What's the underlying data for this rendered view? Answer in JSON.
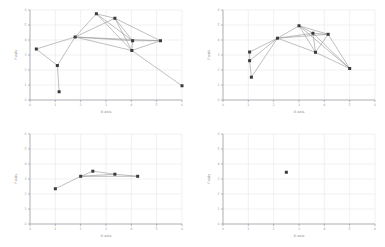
{
  "figure": {
    "background_color": "#ffffff",
    "panel_count": 4,
    "layout": "2x2 grid"
  },
  "style": {
    "edge_color": "#8c8c8c",
    "node_color": "#3a3a3a",
    "grid_color": "#e8e8ec",
    "axis_color": "#9a9aa2",
    "label_color": "#8d8d95"
  },
  "chart_data": [
    {
      "type": "scatter",
      "panel": "top-left",
      "title": "",
      "xlabel": "X-axis",
      "ylabel": "Y-axis",
      "xlim": [
        0,
        6
      ],
      "ylim": [
        0,
        6
      ],
      "xticks": [
        0,
        1,
        2,
        3,
        4,
        5,
        6
      ],
      "yticks": [
        0,
        1,
        2,
        3,
        4,
        5,
        6
      ],
      "grid": true,
      "legend": "none",
      "nodes": [
        {
          "id": 0,
          "x": 0.25,
          "y": 3.4
        },
        {
          "id": 1,
          "x": 1.08,
          "y": 2.3
        },
        {
          "id": 2,
          "x": 1.15,
          "y": 0.55
        },
        {
          "id": 3,
          "x": 1.78,
          "y": 4.2
        },
        {
          "id": 4,
          "x": 2.62,
          "y": 5.75
        },
        {
          "id": 5,
          "x": 3.35,
          "y": 5.45
        },
        {
          "id": 6,
          "x": 4.05,
          "y": 3.95
        },
        {
          "id": 7,
          "x": 4.02,
          "y": 3.3
        },
        {
          "id": 8,
          "x": 5.15,
          "y": 3.95
        },
        {
          "id": 9,
          "x": 6.0,
          "y": 0.95
        }
      ],
      "edges": [
        [
          0,
          1
        ],
        [
          1,
          2
        ],
        [
          1,
          3
        ],
        [
          0,
          3
        ],
        [
          3,
          4
        ],
        [
          3,
          5
        ],
        [
          3,
          6
        ],
        [
          3,
          7
        ],
        [
          3,
          8
        ],
        [
          4,
          5
        ],
        [
          4,
          6
        ],
        [
          4,
          7
        ],
        [
          5,
          6
        ],
        [
          5,
          7
        ],
        [
          5,
          8
        ],
        [
          6,
          7
        ],
        [
          6,
          8
        ],
        [
          7,
          8
        ],
        [
          7,
          9
        ]
      ]
    },
    {
      "type": "scatter",
      "panel": "top-right",
      "title": "",
      "xlabel": "X-axis",
      "ylabel": "Y-axis",
      "xlim": [
        0,
        6
      ],
      "ylim": [
        0,
        6
      ],
      "xticks": [
        0,
        1,
        2,
        3,
        4,
        5,
        6
      ],
      "yticks": [
        0,
        1,
        2,
        3,
        4,
        5,
        6
      ],
      "grid": true,
      "legend": "none",
      "nodes": [
        {
          "id": 0,
          "x": 1.05,
          "y": 3.2
        },
        {
          "id": 1,
          "x": 1.05,
          "y": 2.62
        },
        {
          "id": 2,
          "x": 1.12,
          "y": 1.52
        },
        {
          "id": 3,
          "x": 2.15,
          "y": 4.12
        },
        {
          "id": 4,
          "x": 3.0,
          "y": 4.95
        },
        {
          "id": 5,
          "x": 3.55,
          "y": 4.45
        },
        {
          "id": 6,
          "x": 4.15,
          "y": 4.38
        },
        {
          "id": 7,
          "x": 3.65,
          "y": 3.18
        },
        {
          "id": 8,
          "x": 5.0,
          "y": 2.1
        }
      ],
      "edges": [
        [
          0,
          1
        ],
        [
          1,
          2
        ],
        [
          0,
          3
        ],
        [
          1,
          3
        ],
        [
          2,
          3
        ],
        [
          3,
          4
        ],
        [
          3,
          5
        ],
        [
          3,
          6
        ],
        [
          3,
          7
        ],
        [
          4,
          5
        ],
        [
          4,
          6
        ],
        [
          4,
          7
        ],
        [
          4,
          8
        ],
        [
          5,
          6
        ],
        [
          5,
          7
        ],
        [
          5,
          8
        ],
        [
          6,
          7
        ],
        [
          6,
          8
        ],
        [
          7,
          8
        ]
      ]
    },
    {
      "type": "scatter",
      "panel": "bottom-left",
      "title": "",
      "xlabel": "X-axis",
      "ylabel": "Y-axis",
      "xlim": [
        0,
        6
      ],
      "ylim": [
        0,
        6
      ],
      "xticks": [
        0,
        1,
        2,
        3,
        4,
        5,
        6
      ],
      "yticks": [
        0,
        1,
        2,
        3,
        4,
        5,
        6
      ],
      "grid": true,
      "legend": "none",
      "nodes": [
        {
          "id": 0,
          "x": 1.0,
          "y": 2.35
        },
        {
          "id": 1,
          "x": 2.0,
          "y": 3.18
        },
        {
          "id": 2,
          "x": 2.48,
          "y": 3.52
        },
        {
          "id": 3,
          "x": 3.35,
          "y": 3.32
        },
        {
          "id": 4,
          "x": 4.25,
          "y": 3.18
        }
      ],
      "edges": [
        [
          0,
          1
        ],
        [
          1,
          2
        ],
        [
          2,
          3
        ],
        [
          3,
          4
        ],
        [
          1,
          4
        ],
        [
          1,
          3
        ]
      ]
    },
    {
      "type": "scatter",
      "panel": "bottom-right",
      "title": "",
      "xlabel": "X-axis",
      "ylabel": "Y-axis",
      "xlim": [
        0,
        6
      ],
      "ylim": [
        0,
        6
      ],
      "xticks": [
        0,
        1,
        2,
        3,
        4,
        5,
        6
      ],
      "yticks": [
        0,
        1,
        2,
        3,
        4,
        5,
        6
      ],
      "grid": true,
      "legend": "none",
      "nodes": [
        {
          "id": 0,
          "x": 2.5,
          "y": 3.45
        }
      ],
      "edges": []
    }
  ]
}
